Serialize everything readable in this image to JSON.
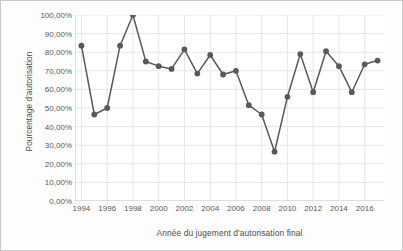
{
  "chart_data": {
    "type": "line",
    "title": "",
    "subtitle": "",
    "xlabel": "Année du jugement d'autorisation final",
    "ylabel": "Pourcentage d'autorisation",
    "x": [
      1994,
      1995,
      1996,
      1997,
      1998,
      1999,
      2000,
      2001,
      2002,
      2003,
      2004,
      2005,
      2006,
      2007,
      2008,
      2009,
      2010,
      2011,
      2012,
      2013,
      2014,
      2015,
      2016,
      2017
    ],
    "values": [
      83.5,
      46.5,
      50.0,
      83.5,
      100.0,
      75.0,
      72.5,
      71.0,
      81.5,
      68.5,
      78.5,
      68.0,
      70.0,
      51.5,
      46.5,
      26.5,
      56.0,
      79.0,
      58.5,
      80.5,
      72.5,
      58.5,
      73.5,
      75.5
    ],
    "series": [
      {
        "name": "Pourcentage d'autorisation",
        "values": [
          83.5,
          46.5,
          50.0,
          83.5,
          100.0,
          75.0,
          72.5,
          71.0,
          81.5,
          68.5,
          78.5,
          68.0,
          70.0,
          51.5,
          46.5,
          26.5,
          56.0,
          79.0,
          58.5,
          80.5,
          72.5,
          58.5,
          73.5,
          75.5
        ]
      }
    ],
    "xlim": [
      1993.5,
      2017.5
    ],
    "ylim": [
      0,
      100
    ],
    "y_tick_values": [
      0,
      10,
      20,
      30,
      40,
      50,
      60,
      70,
      80,
      90,
      100
    ],
    "y_tick_labels": [
      "0,00%",
      "10,00%",
      "20,00%",
      "30,00%",
      "40,00%",
      "50,00%",
      "60,00%",
      "70,00%",
      "80,00%",
      "90,00%",
      "100,00%"
    ],
    "x_tick_values": [
      1994,
      1996,
      1998,
      2000,
      2002,
      2004,
      2006,
      2008,
      2010,
      2012,
      2014,
      2016
    ],
    "x_tick_labels": [
      "1994",
      "1996",
      "1998",
      "2000",
      "2002",
      "2004",
      "2006",
      "2008",
      "2010",
      "2012",
      "2014",
      "2016"
    ],
    "grid": {
      "horizontal": true,
      "vertical": true
    },
    "legend": {
      "visible": false,
      "position": "none"
    },
    "marker": "circle",
    "colors": {
      "line": "#595959",
      "marker": "#595959",
      "grid": "#e4e6ea",
      "axis": "#bfbfbf",
      "tick_text": "#595959",
      "axis_title": "#4a4a4a",
      "plot_background": "#ffffff",
      "figure_background": "#fdfdfd",
      "figure_border": "#c9c9c9"
    }
  }
}
